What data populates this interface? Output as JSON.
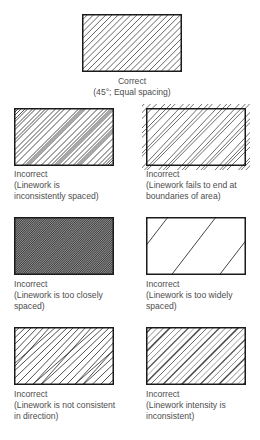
{
  "figure": {
    "panels": [
      {
        "id": "correct",
        "status": "Correct",
        "description": "(45°; Equal spacing)",
        "desc_lines": [
          "(45°; Equal spacing)"
        ],
        "box": {
          "x": 82,
          "y": 14,
          "w": 100,
          "h": 58
        },
        "hatch": "even"
      },
      {
        "id": "inconsistent-spacing",
        "status": "Incorrect",
        "description": "(Linework is inconsistently spaced)",
        "desc_lines": [
          "(Linework is",
          "inconsistently spaced)"
        ],
        "box": {
          "x": 14,
          "y": 108,
          "w": 100,
          "h": 58
        },
        "hatch": "uneven"
      },
      {
        "id": "overrun-boundaries",
        "status": "Incorrect",
        "description": "(Linework fails to end at boundaries of area)",
        "desc_lines": [
          "(Linework fails to end at",
          "boundaries of area)"
        ],
        "box": {
          "x": 146,
          "y": 108,
          "w": 100,
          "h": 58
        },
        "hatch": "overrun"
      },
      {
        "id": "too-close",
        "status": "Incorrect",
        "description": "(Linework is too closely spaced)",
        "desc_lines": [
          "(Linework is too closely",
          "spaced)"
        ],
        "box": {
          "x": 14,
          "y": 217,
          "w": 100,
          "h": 58
        },
        "hatch": "dense"
      },
      {
        "id": "too-wide",
        "status": "Incorrect",
        "description": "(Linework is too widely spaced)",
        "desc_lines": [
          "(Linework is too widely",
          "spaced)"
        ],
        "box": {
          "x": 146,
          "y": 217,
          "w": 100,
          "h": 58
        },
        "hatch": "sparse"
      },
      {
        "id": "inconsistent-direction",
        "status": "Incorrect",
        "description": "(Linework is not consistent in direction)",
        "desc_lines": [
          "(Linework is not consistent",
          "in direction)"
        ],
        "box": {
          "x": 14,
          "y": 327,
          "w": 100,
          "h": 58
        },
        "hatch": "direction"
      },
      {
        "id": "inconsistent-intensity",
        "status": "Incorrect",
        "description": "(Linework intensity is inconsistent)",
        "desc_lines": [
          "(Linework intensity is",
          "inconsistent)"
        ],
        "box": {
          "x": 146,
          "y": 327,
          "w": 100,
          "h": 58
        },
        "hatch": "intensity"
      }
    ],
    "colors": {
      "line": "#1a1a1a",
      "caption": "#4d4d4d",
      "background": "#ffffff"
    }
  }
}
